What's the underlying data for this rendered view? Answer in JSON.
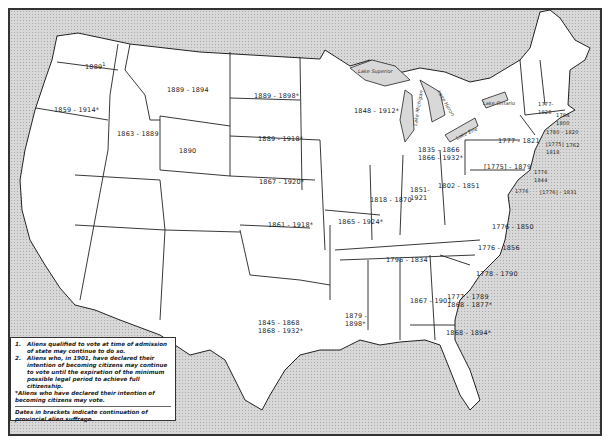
{
  "map": {
    "subject": "Alien suffrage periods by state",
    "states": [
      {
        "state": "Washington",
        "label": "1889",
        "note": "1"
      },
      {
        "state": "Oregon",
        "label": "1859 - 1914*"
      },
      {
        "state": "Idaho",
        "label": "1863 - 1889"
      },
      {
        "state": "Montana",
        "label": "1889 - 1894"
      },
      {
        "state": "Wyoming",
        "label": "1890"
      },
      {
        "state": "North Dakota",
        "label": "1889 - 1898*"
      },
      {
        "state": "South Dakota",
        "label": "1889 - 1918*"
      },
      {
        "state": "Nebraska",
        "label": "1867 - 1920*"
      },
      {
        "state": "Kansas",
        "label": "1861 - 1918*"
      },
      {
        "state": "Texas",
        "label": "1845 - 1868\n1868 - 1932*"
      },
      {
        "state": "Louisiana",
        "label": "1879 - 1898*"
      },
      {
        "state": "Missouri",
        "label": "1865 - 1924*"
      },
      {
        "state": "Illinois",
        "label": "1818 - 1870"
      },
      {
        "state": "Wisconsin",
        "label": "1848 - 1912*"
      },
      {
        "state": "Michigan",
        "label": "1835 - 1866\n1866 - 1932*"
      },
      {
        "state": "Indiana",
        "label": "1851 - 1921"
      },
      {
        "state": "Ohio",
        "label": "1802 - 1851"
      },
      {
        "state": "Tennessee",
        "label": "1796 - 1834"
      },
      {
        "state": "Alabama",
        "label": "1867 - 1901",
        "note": "2"
      },
      {
        "state": "Georgia",
        "label": "1777 - 1789\n1868 - 1877*"
      },
      {
        "state": "Florida",
        "label": "1868 - 1894*"
      },
      {
        "state": "South Carolina",
        "label": "1778 - 1790"
      },
      {
        "state": "North Carolina",
        "label": "1776 - 1856"
      },
      {
        "state": "Virginia",
        "label": "1776 - 1850"
      },
      {
        "state": "Pennsylvania",
        "label": "[1775] - 1879"
      },
      {
        "state": "New York",
        "label": "1777 - 1821"
      },
      {
        "state": "Vermont",
        "label": "1777 - 1828"
      },
      {
        "state": "New Hampshire",
        "label": "1784 - 1800"
      },
      {
        "state": "Massachusetts",
        "label": "1780 - 1820"
      },
      {
        "state": "Connecticut",
        "label": "[1775] - 1818"
      },
      {
        "state": "Rhode Island",
        "label": "1762"
      },
      {
        "state": "New Jersey",
        "label": "1776 - 1844"
      },
      {
        "state": "Delaware",
        "label": "[1776] - 1831"
      },
      {
        "state": "Maryland",
        "label": "1776"
      }
    ],
    "lakes": [
      "Lake Superior",
      "Lake Michigan",
      "Lake Huron",
      "Lake Erie",
      "Lake Ontario"
    ]
  },
  "legend": {
    "notes": [
      {
        "num": "1.",
        "text": "Aliens qualified to vote at time of admission of state may continue to do so."
      },
      {
        "num": "2.",
        "text": "Aliens who, in 1901, have declared their intention of becoming citizens may continue to vote until the expiration of the minimum possible legal period to achieve full citizenship."
      }
    ],
    "asterisk": "*Aliens who have declared their intention of becoming citizens may vote.",
    "brackets": "Dates in brackets indicate continuation of provincial alien suffrage."
  }
}
